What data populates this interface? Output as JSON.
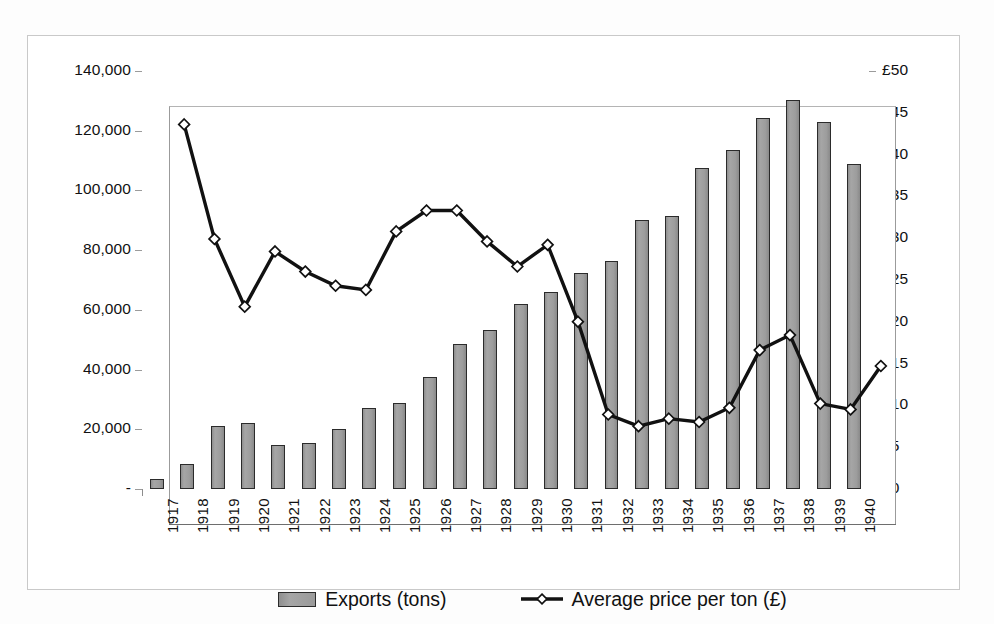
{
  "chart_data": {
    "type": "bar",
    "title": "",
    "subtitle": "",
    "xlabel": "",
    "ylabel": "",
    "grid": false,
    "legend_position": "bottom-center",
    "categories": [
      "1917",
      "1918",
      "1919",
      "1920",
      "1921",
      "1922",
      "1923",
      "1924",
      "1925",
      "1926",
      "1927",
      "1928",
      "1929",
      "1930",
      "1931",
      "1932",
      "1933",
      "1934",
      "1935",
      "1936",
      "1937",
      "1938",
      "1939",
      "1940"
    ],
    "axes": {
      "left": {
        "label": "Exports (tons)",
        "ylim": [
          0,
          140000
        ],
        "tick_values": [
          0,
          20000,
          40000,
          60000,
          80000,
          100000,
          120000,
          140000
        ],
        "tick_labels": [
          "-",
          "20,000",
          "40,000",
          "60,000",
          "80,000",
          "100,000",
          "120,000",
          "140,000"
        ]
      },
      "right": {
        "label": "Average price per ton (£)",
        "ylim": [
          0,
          50
        ],
        "tick_values": [
          0,
          5,
          10,
          15,
          20,
          25,
          30,
          35,
          40,
          45,
          50
        ],
        "tick_labels": [
          "£0",
          "£5",
          "£10",
          "£15",
          "£20",
          "£25",
          "£30",
          "£35",
          "£40",
          "£45",
          "£50"
        ]
      }
    },
    "series": [
      {
        "name": "Exports (tons)",
        "type": "bar",
        "axis": "left",
        "values": [
          3500,
          8500,
          21000,
          22200,
          14700,
          15300,
          20200,
          27200,
          28800,
          37500,
          48700,
          53200,
          61800,
          65900,
          72500,
          76500,
          90100,
          91400,
          107400,
          113400,
          124400,
          130400,
          122900,
          108900
        ]
      },
      {
        "name": "Average price per ton (£)",
        "type": "line",
        "axis": "right",
        "marker": "diamond",
        "values": [
          47.8,
          34.1,
          26.0,
          32.6,
          30.2,
          28.5,
          28.0,
          35.0,
          37.5,
          37.5,
          33.8,
          30.8,
          33.4,
          24.2,
          13.1,
          11.7,
          12.6,
          12.2,
          13.9,
          20.8,
          22.6,
          14.4,
          13.7,
          18.9
        ]
      }
    ]
  },
  "legend": {
    "entries": [
      {
        "label": "Exports (tons)",
        "swatch": "bar-swatch",
        "color": "#9a9a9a"
      },
      {
        "label": "Average price per ton (£)",
        "swatch": "line-marker-swatch",
        "color": "#111111"
      }
    ]
  },
  "colors": {
    "bar_fill": "#9a9a9a",
    "bar_border": "#2b2b2b",
    "line": "#111111",
    "marker_fill": "#ffffff",
    "frame": "#c9c9c9",
    "axis": "#9b9b9b",
    "background": "#ffffff"
  }
}
